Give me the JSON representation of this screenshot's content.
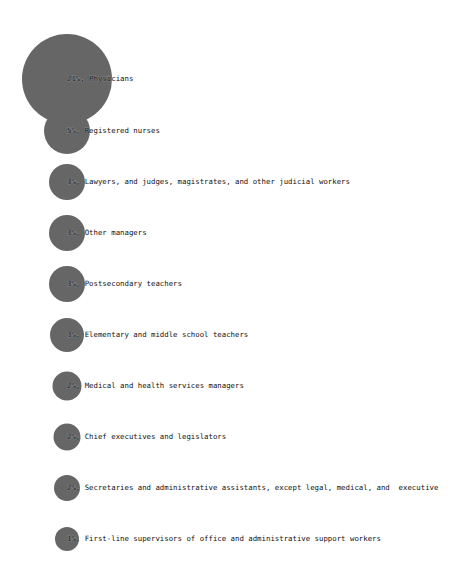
{
  "chart_data": {
    "type": "bubble",
    "title": "",
    "xlabel": "",
    "ylabel": "",
    "grid": false,
    "legend": null,
    "bubble_color": "#666666",
    "label_color": "#111111",
    "categories": [
      "Physicians",
      "Registered nurses",
      "Lawyers, and judges, magistrates, and other judicial workers",
      "Other managers",
      "Postsecondary teachers",
      "Elementary and middle school teachers",
      "Medical and health services managers",
      "Chief executives and legislators",
      "Secretaries and administrative assistants, except legal, medical, and  executive",
      "First-line supervisors of office and administrative support workers"
    ],
    "values": [
      21,
      5,
      3,
      3,
      3,
      3,
      2,
      2,
      2,
      1
    ],
    "value_unit": "%",
    "items": [
      {
        "pct": "21%",
        "name": "Physicians",
        "label": "21%, Physicians",
        "cx": 67,
        "cy": 79,
        "r": 45
      },
      {
        "pct": "5%",
        "name": "Registered nurses",
        "label": "5%, Registered nurses",
        "cx": 67,
        "cy": 131,
        "r": 23
      },
      {
        "pct": "3%",
        "name": "Lawyers, and judges, magistrates, and other judicial workers",
        "label": "3%, Lawyers, and judges, magistrates, and other judicial workers",
        "cx": 67,
        "cy": 182,
        "r": 18
      },
      {
        "pct": "3%",
        "name": "Other managers",
        "label": "3%, Other managers",
        "cx": 67,
        "cy": 233,
        "r": 18
      },
      {
        "pct": "3%",
        "name": "Postsecondary teachers",
        "label": "3%, Postsecondary teachers",
        "cx": 67,
        "cy": 284,
        "r": 18
      },
      {
        "pct": "3%",
        "name": "Elementary and middle school teachers",
        "label": "3%, Elementary and middle school teachers",
        "cx": 67,
        "cy": 335,
        "r": 17
      },
      {
        "pct": "2%",
        "name": "Medical and health services managers",
        "label": "2%, Medical and health services managers",
        "cx": 67,
        "cy": 386,
        "r": 14.5
      },
      {
        "pct": "2%",
        "name": "Chief executives and legislators",
        "label": "2%, Chief executives and legislators",
        "cx": 67,
        "cy": 437,
        "r": 13.5
      },
      {
        "pct": "2%",
        "name": "Secretaries and administrative assistants, except legal, medical, and  executive",
        "label": "2%, Secretaries and administrative assistants, except legal, medical, and  executive",
        "cx": 67,
        "cy": 488,
        "r": 13
      },
      {
        "pct": "1%",
        "name": "First-line supervisors of office and administrative support workers",
        "label": "1%, First-line supervisors of office and administrative support workers",
        "cx": 67,
        "cy": 539,
        "r": 12
      }
    ]
  }
}
